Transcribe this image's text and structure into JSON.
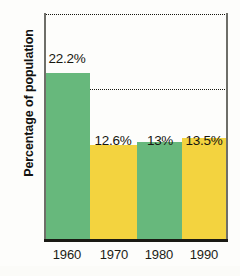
{
  "chart_data": {
    "type": "bar",
    "title": "",
    "subtitle": "",
    "xlabel": "",
    "ylabel": "Percentage of population",
    "categories": [
      "1960",
      "1970",
      "1980",
      "1990"
    ],
    "values": [
      22.2,
      12.6,
      13,
      13.5
    ],
    "data_labels": [
      "22.2%",
      "12.6%",
      "13%",
      "13.5%"
    ],
    "series": [
      {
        "name": "Percentage of population",
        "values": [
          22.2,
          12.6,
          13,
          13.5
        ]
      }
    ],
    "bar_colors": [
      "#67b87c",
      "#f3d33f",
      "#67b87c",
      "#f3d33f"
    ],
    "ylim": [
      0,
      30
    ],
    "y_ticks": [
      0,
      10,
      20,
      30
    ],
    "y_tick_labels": [
      "0",
      "10",
      "20",
      "30"
    ],
    "grid": true,
    "grid_style": "dotted",
    "grid_axis": "y",
    "legend": false,
    "legend_position": "none",
    "axis_color": "#1a1a14",
    "grid_color": "#16160f",
    "background": "#ffffff"
  },
  "axes": {
    "y_title": "Percentage of population",
    "y_tick_labels": [
      "30",
      "20",
      "10",
      "0"
    ],
    "x_tick_labels": [
      "1960",
      "1970",
      "1980",
      "1990"
    ]
  },
  "bars": [
    {
      "category": "1960",
      "label": "22.2%",
      "value": 22.2,
      "color": "#67b87c"
    },
    {
      "category": "1970",
      "label": "12.6%",
      "value": 12.6,
      "color": "#f3d33f"
    },
    {
      "category": "1980",
      "label": "13%",
      "value": 13,
      "color": "#67b87c"
    },
    {
      "category": "1990",
      "label": "13.5%",
      "value": 13.5,
      "color": "#f3d33f"
    }
  ]
}
